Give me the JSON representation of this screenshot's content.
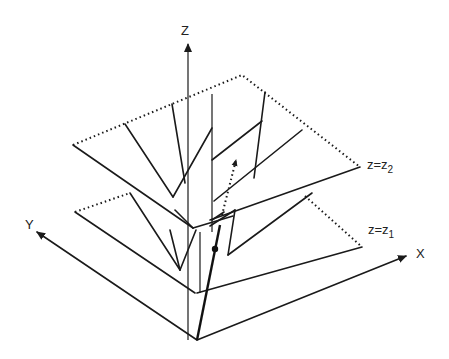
{
  "figure": {
    "type": "3D axes diagram with two stacked piecewise-planar cone surfaces and a trajectory",
    "axes": {
      "z_label": "Z",
      "y_label": "Y",
      "x_label": "X"
    },
    "planes": [
      {
        "id": "upper",
        "label_main": "z=z",
        "label_sub": "2"
      },
      {
        "id": "lower",
        "label_main": "z=z",
        "label_sub": "1"
      }
    ],
    "trajectory": {
      "solid_segment": "bold line rising from origin through lower plane with a dot marker",
      "dotted_segment": "dotted arrow continuing upward toward upper plane"
    },
    "colors": {
      "ink": "#1a1a1a",
      "background": "#ffffff"
    }
  }
}
